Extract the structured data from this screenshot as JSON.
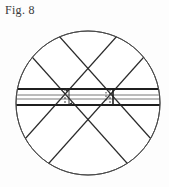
{
  "figure": {
    "label": "Fig. 8",
    "caption_text": "Fig. 8",
    "background_color": "#fdfdfd",
    "ink_color": "#2b2b2b",
    "outline_color": "#4a4a4a"
  },
  "geometry": {
    "circle": {
      "center_x": 88,
      "center_y": 103,
      "radius": 72,
      "stroke_width": 1
    },
    "horizontal_band": {
      "top_edge_y": 89,
      "bottom_edge_y": 105,
      "inner_line_1_y": 95,
      "inner_line_2_y": 99,
      "thick_stroke_width": 2,
      "thin_stroke_width": 0.8,
      "left_x": 16,
      "right_x": 160
    },
    "diagonal_band_a": {
      "description": "upper-left to lower-right band",
      "angle_degrees": 48,
      "half_width": 13
    },
    "diagonal_band_b": {
      "description": "upper-right to lower-left band",
      "angle_degrees": -48,
      "half_width": 13
    },
    "center_marks": {
      "left_dashed_x": 65,
      "right_dashed_x": 110,
      "dash_pattern": "2,2"
    }
  },
  "annotations": {
    "left_dimension_label": "",
    "right_dimension_label": "",
    "arrow_count": 4
  }
}
